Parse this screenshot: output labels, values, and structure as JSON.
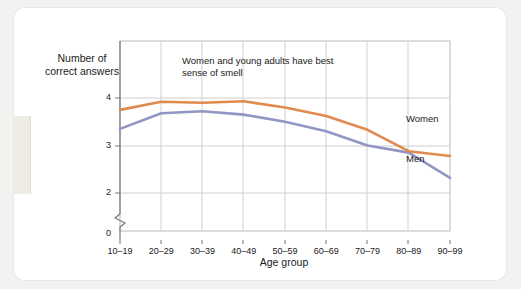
{
  "chart_data": {
    "type": "line",
    "title": "",
    "xlabel": "Age group",
    "ylabel": "Number of\ncorrect answers",
    "ylabel_line1": "Number of",
    "ylabel_line2": "correct answers",
    "categories": [
      "10–19",
      "20–29",
      "30–39",
      "40–49",
      "50–59",
      "60–69",
      "70–79",
      "80–89",
      "90–99"
    ],
    "yticks": [
      "0",
      "2",
      "3",
      "4"
    ],
    "ylim": [
      2,
      4.4
    ],
    "axis_break": true,
    "grid": true,
    "legend_position": "inline-right",
    "annotation": "Women and young adults have best sense of smell",
    "series": [
      {
        "name": "Women",
        "color": "#e08a4e",
        "values": [
          3.75,
          3.92,
          3.9,
          3.93,
          3.8,
          3.62,
          3.33,
          2.88,
          2.78
        ]
      },
      {
        "name": "Men",
        "color": "#9196c4",
        "values": [
          3.35,
          3.68,
          3.72,
          3.65,
          3.5,
          3.3,
          3.0,
          2.85,
          2.32
        ]
      }
    ]
  },
  "labels": {
    "women": "Women",
    "men": "Men"
  }
}
